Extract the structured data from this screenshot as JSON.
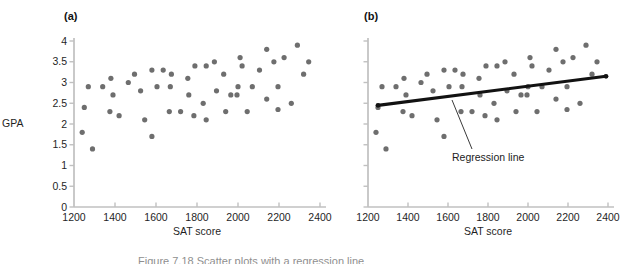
{
  "figure": {
    "caption_partial": "Figure 7.18 Scatter plots with a regression line",
    "background": "#ffffff"
  },
  "chart_data": {
    "type": "scatter",
    "title": "",
    "panels": [
      {
        "label": "(a)",
        "xlabel": "SAT score",
        "ylabel": "GPA",
        "has_regression_line": false
      },
      {
        "label": "(b)",
        "xlabel": "SAT score",
        "ylabel": "",
        "has_regression_line": true,
        "annotation": "Regression line"
      }
    ],
    "x_axis": {
      "label": "SAT score",
      "min": 1200,
      "max": 2400,
      "tick_step": 200,
      "ticks": [
        1200,
        1400,
        1600,
        1800,
        2000,
        2200,
        2400
      ]
    },
    "y_axis": {
      "label": "GPA",
      "min": 0,
      "max": 4,
      "tick_step": 0.5,
      "ticks": [
        "0",
        "0.5",
        "1",
        "1.5",
        "2",
        "2.5",
        "3",
        "3.5",
        "4"
      ],
      "labels_shown_on_panels": [
        "(a)"
      ]
    },
    "points": [
      [
        1240,
        1.8
      ],
      [
        1250,
        2.4
      ],
      [
        1270,
        2.9
      ],
      [
        1290,
        1.4
      ],
      [
        1340,
        2.9
      ],
      [
        1375,
        2.3
      ],
      [
        1380,
        3.1
      ],
      [
        1390,
        2.7
      ],
      [
        1420,
        2.2
      ],
      [
        1465,
        3.0
      ],
      [
        1495,
        3.2
      ],
      [
        1525,
        2.8
      ],
      [
        1545,
        2.1
      ],
      [
        1580,
        3.3
      ],
      [
        1580,
        1.7
      ],
      [
        1605,
        2.9
      ],
      [
        1635,
        3.3
      ],
      [
        1665,
        2.3
      ],
      [
        1670,
        2.9
      ],
      [
        1675,
        3.2
      ],
      [
        1720,
        2.3
      ],
      [
        1755,
        3.1
      ],
      [
        1760,
        2.7
      ],
      [
        1785,
        2.2
      ],
      [
        1790,
        3.4
      ],
      [
        1830,
        2.5
      ],
      [
        1845,
        3.4
      ],
      [
        1845,
        2.1
      ],
      [
        1885,
        3.5
      ],
      [
        1895,
        2.8
      ],
      [
        1930,
        3.2
      ],
      [
        1940,
        2.3
      ],
      [
        1965,
        2.7
      ],
      [
        1995,
        2.7
      ],
      [
        2000,
        2.9
      ],
      [
        2010,
        3.6
      ],
      [
        2020,
        3.4
      ],
      [
        2045,
        2.3
      ],
      [
        2070,
        2.9
      ],
      [
        2105,
        3.3
      ],
      [
        2140,
        3.8
      ],
      [
        2140,
        2.6
      ],
      [
        2175,
        3.5
      ],
      [
        2195,
        2.9
      ],
      [
        2195,
        2.35
      ],
      [
        2225,
        3.6
      ],
      [
        2260,
        2.5
      ],
      [
        2290,
        3.9
      ],
      [
        2320,
        3.2
      ],
      [
        2345,
        3.5
      ]
    ],
    "regression_line": {
      "x1": 1250,
      "y1": 2.45,
      "x2": 2390,
      "y2": 3.15,
      "color": "#121212"
    },
    "colors": {
      "dot": "#6e6e6e",
      "axis": "#c0c0c0",
      "text": "#1f1f1f"
    }
  }
}
